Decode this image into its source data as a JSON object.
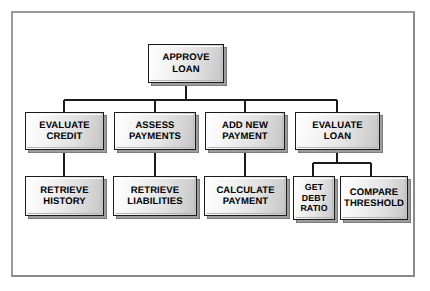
{
  "diagram": {
    "type": "hierarchy-tree",
    "frame_color": "#8c8c8c",
    "node_outline_color": "#1a1a1a",
    "node_fill_light": "#ffffff",
    "node_fill_dark": "#c4c4c4",
    "connector_color": "#1a1a1a"
  },
  "nodes": {
    "root": {
      "label": "APPROVE\nLOAN"
    },
    "level2": [
      {
        "label": "EVALUATE\nCREDIT"
      },
      {
        "label": "ASSESS\nPAYMENTS"
      },
      {
        "label": "ADD NEW\nPAYMENT"
      },
      {
        "label": "EVALUATE\nLOAN"
      }
    ],
    "level3": [
      {
        "label": "RETRIEVE\nHISTORY"
      },
      {
        "label": "RETRIEVE\nLIABILITIES"
      },
      {
        "label": "CALCULATE\nPAYMENT"
      },
      {
        "label": "GET\nDEBT\nRATIO"
      },
      {
        "label": "COMPARE\nTHRESHOLD"
      }
    ]
  }
}
